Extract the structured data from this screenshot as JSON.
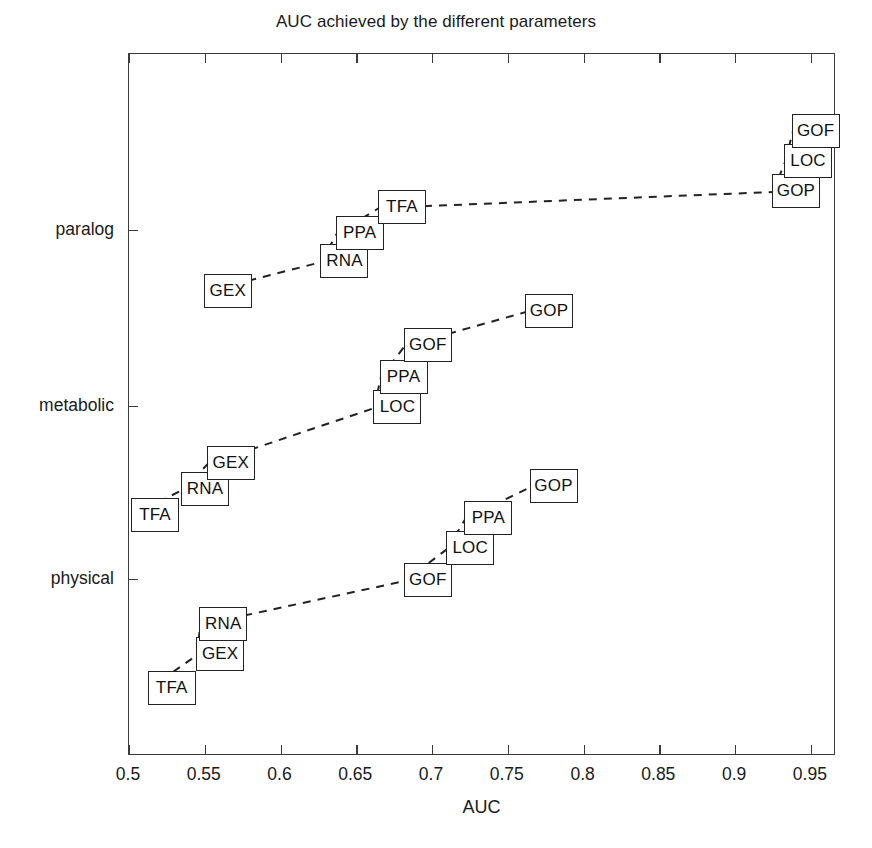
{
  "chart_data": {
    "type": "scatter",
    "title": "AUC achieved by the different parameters",
    "xlabel": "AUC",
    "ylabel": "",
    "xlim": [
      0.5,
      0.9666
    ],
    "xticks": [
      "0.5",
      "0.55",
      "0.6",
      "0.65",
      "0.7",
      "0.75",
      "0.8",
      "0.85",
      "0.9",
      "0.95"
    ],
    "xtick_values": [
      0.5,
      0.55,
      0.6,
      0.65,
      0.7,
      0.75,
      0.8,
      0.85,
      0.9,
      0.95
    ],
    "ycategories": [
      "physical",
      "metabolic",
      "paralog"
    ],
    "grid": false,
    "legend": null,
    "line_style": "dashed",
    "marker_style": "text-box",
    "series": [
      {
        "name": "paralog",
        "category": "paralog",
        "points": [
          {
            "label": "GEX",
            "x": 0.55,
            "y_offset": -62
          },
          {
            "label": "RNA",
            "x": 0.627,
            "y_offset": -32
          },
          {
            "label": "PPA",
            "x": 0.637,
            "y_offset": -4
          },
          {
            "label": "TFA",
            "x": 0.665,
            "y_offset": 22
          },
          {
            "label": "GOP",
            "x": 0.925,
            "y_offset": 38
          },
          {
            "label": "LOC",
            "x": 0.933,
            "y_offset": 68
          },
          {
            "label": "GOF",
            "x": 0.938,
            "y_offset": 98
          }
        ]
      },
      {
        "name": "metabolic",
        "category": "metabolic",
        "points": [
          {
            "label": "TFA",
            "x": 0.502,
            "y_offset": -110
          },
          {
            "label": "RNA",
            "x": 0.535,
            "y_offset": -84
          },
          {
            "label": "GEX",
            "x": 0.552,
            "y_offset": -58
          },
          {
            "label": "LOC",
            "x": 0.662,
            "y_offset": -2
          },
          {
            "label": "PPA",
            "x": 0.666,
            "y_offset": 28
          },
          {
            "label": "GOF",
            "x": 0.682,
            "y_offset": 60
          },
          {
            "label": "GOP",
            "x": 0.762,
            "y_offset": 94
          }
        ]
      },
      {
        "name": "physical",
        "category": "physical",
        "points": [
          {
            "label": "TFA",
            "x": 0.513,
            "y_offset": -110
          },
          {
            "label": "GEX",
            "x": 0.545,
            "y_offset": -76
          },
          {
            "label": "RNA",
            "x": 0.547,
            "y_offset": -46
          },
          {
            "label": "GOF",
            "x": 0.682,
            "y_offset": -2
          },
          {
            "label": "LOC",
            "x": 0.71,
            "y_offset": 30
          },
          {
            "label": "PPA",
            "x": 0.722,
            "y_offset": 60
          },
          {
            "label": "GOP",
            "x": 0.765,
            "y_offset": 92
          }
        ]
      }
    ],
    "colors": {
      "axis": "#3b3b3b",
      "line": "#222222",
      "box_border": "#222222",
      "background": "#ffffff",
      "text": "#111111"
    }
  }
}
